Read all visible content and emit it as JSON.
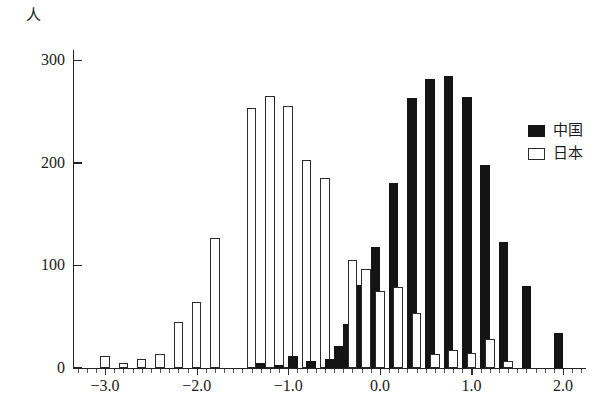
{
  "chart_data": {
    "type": "bar",
    "title": "",
    "subtitle": "",
    "xlabel": "",
    "ylabel": "人",
    "ylim": [
      0,
      310
    ],
    "xlim": [
      -3.35,
      2.25
    ],
    "grid": false,
    "legend_position": "right",
    "y_ticks": [
      0,
      100,
      200,
      300
    ],
    "y_tick_labels": [
      "0",
      "100",
      "200",
      "300"
    ],
    "x_ticks": [
      -3.0,
      -2.0,
      -1.0,
      0.0,
      1.0,
      2.0
    ],
    "x_tick_labels": [
      "−3.0",
      "−2.0",
      "−1.0",
      "0.0",
      "1.0",
      "2.0"
    ],
    "bin_width": 0.1,
    "x": [
      -3.2,
      -3.1,
      -3.0,
      -2.9,
      -2.8,
      -2.7,
      -2.6,
      -2.5,
      -2.4,
      -2.3,
      -2.2,
      -2.1,
      -2.0,
      -1.9,
      -1.8,
      -1.7,
      -1.6,
      -1.5,
      -1.4,
      -1.3,
      -1.2,
      -1.1,
      -1.0,
      -0.9,
      -0.8,
      -0.7,
      -0.6,
      -0.5,
      -0.4,
      -0.3,
      -0.2,
      -0.1,
      0.0,
      0.1,
      0.2,
      0.3,
      0.4,
      0.5,
      0.6,
      0.7,
      0.8,
      0.9,
      1.0,
      1.1,
      1.2,
      1.3,
      1.4,
      1.5,
      1.6,
      1.7,
      1.8,
      1.9,
      2.0
    ],
    "series": [
      {
        "name": "中国",
        "color": "#141414",
        "style": "filled",
        "values": [
          0,
          0,
          0,
          0,
          0,
          0,
          0,
          0,
          0,
          0,
          0,
          0,
          0,
          0,
          0,
          0,
          0,
          0,
          0,
          5,
          3,
          0,
          12,
          7,
          9,
          0,
          21,
          0,
          43,
          0,
          81,
          0,
          118,
          0,
          180,
          0,
          263,
          0,
          282,
          0,
          285,
          0,
          264,
          0,
          198,
          0,
          123,
          0,
          80,
          0,
          0,
          0,
          34
        ]
      },
      {
        "name": "日本",
        "color": "#ffffff",
        "style": "outlined",
        "values": [
          0,
          0,
          12,
          0,
          5,
          0,
          9,
          0,
          14,
          0,
          45,
          0,
          64,
          0,
          127,
          0,
          0,
          0,
          253,
          0,
          265,
          0,
          255,
          0,
          203,
          0,
          185,
          0,
          105,
          0,
          97,
          0,
          75,
          0,
          79,
          0,
          54,
          0,
          14,
          0,
          18,
          0,
          15,
          0,
          28,
          0,
          7,
          0,
          0,
          0,
          0,
          0,
          0
        ]
      }
    ],
    "bars": [
      {
        "x": -3.0,
        "series": "日本",
        "value": 12
      },
      {
        "x": -2.8,
        "series": "日本",
        "value": 5
      },
      {
        "x": -2.6,
        "series": "日本",
        "value": 9
      },
      {
        "x": -2.4,
        "series": "日本",
        "value": 14
      },
      {
        "x": -2.2,
        "series": "日本",
        "value": 45
      },
      {
        "x": -2.0,
        "series": "日本",
        "value": 64
      },
      {
        "x": -1.8,
        "series": "日本",
        "value": 127
      },
      {
        "x": -1.4,
        "series": "日本",
        "value": 253
      },
      {
        "x": -1.3,
        "series": "中国",
        "value": 5
      },
      {
        "x": -1.2,
        "series": "日本",
        "value": 265
      },
      {
        "x": -1.1,
        "series": "中国",
        "value": 3
      },
      {
        "x": -1.0,
        "series": "日本",
        "value": 255
      },
      {
        "x": -0.95,
        "series": "中国",
        "value": 12
      },
      {
        "x": -0.8,
        "series": "日本",
        "value": 203
      },
      {
        "x": -0.75,
        "series": "中国",
        "value": 7
      },
      {
        "x": -0.6,
        "series": "日本",
        "value": 185
      },
      {
        "x": -0.55,
        "series": "中国",
        "value": 9
      },
      {
        "x": -0.45,
        "series": "中国",
        "value": 21
      },
      {
        "x": -0.35,
        "series": "中国",
        "value": 43
      },
      {
        "x": -0.3,
        "series": "日本",
        "value": 105
      },
      {
        "x": -0.2,
        "series": "中国",
        "value": 81
      },
      {
        "x": -0.15,
        "series": "日本",
        "value": 97
      },
      {
        "x": -0.05,
        "series": "中国",
        "value": 118
      },
      {
        "x": 0.0,
        "series": "日本",
        "value": 75
      },
      {
        "x": 0.15,
        "series": "中国",
        "value": 180
      },
      {
        "x": 0.2,
        "series": "日本",
        "value": 79
      },
      {
        "x": 0.35,
        "series": "中国",
        "value": 263
      },
      {
        "x": 0.4,
        "series": "日本",
        "value": 54
      },
      {
        "x": 0.55,
        "series": "中国",
        "value": 282
      },
      {
        "x": 0.6,
        "series": "日本",
        "value": 14
      },
      {
        "x": 0.75,
        "series": "中国",
        "value": 285
      },
      {
        "x": 0.8,
        "series": "日本",
        "value": 18
      },
      {
        "x": 0.95,
        "series": "中国",
        "value": 264
      },
      {
        "x": 1.0,
        "series": "日本",
        "value": 15
      },
      {
        "x": 1.15,
        "series": "中国",
        "value": 198
      },
      {
        "x": 1.2,
        "series": "日本",
        "value": 28
      },
      {
        "x": 1.35,
        "series": "中国",
        "value": 123
      },
      {
        "x": 1.4,
        "series": "日本",
        "value": 7
      },
      {
        "x": 1.6,
        "series": "中国",
        "value": 80
      },
      {
        "x": 1.95,
        "series": "中国",
        "value": 34
      }
    ]
  },
  "legend": {
    "items": [
      {
        "label": "中国",
        "swatch": "filled",
        "color": "#141414"
      },
      {
        "label": "日本",
        "swatch": "outlined",
        "color": "#ffffff"
      }
    ]
  }
}
